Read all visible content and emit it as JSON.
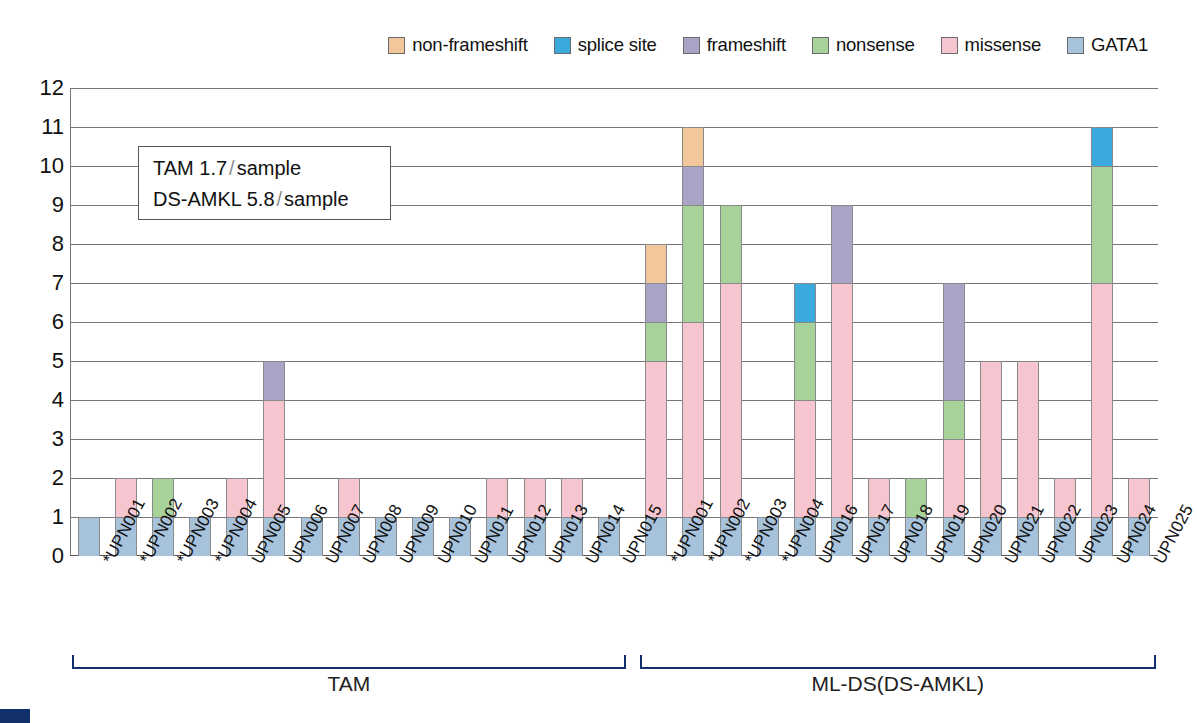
{
  "chart_data": {
    "type": "bar",
    "subtype": "stacked-bar",
    "title": "",
    "xlabel": "",
    "ylabel": "",
    "ylim": [
      0,
      12
    ],
    "ytick_labels": [
      "0",
      "1",
      "2",
      "3",
      "4",
      "5",
      "6",
      "7",
      "8",
      "9",
      "10",
      "11",
      "12"
    ],
    "grid": true,
    "legend_position": "top-right",
    "series": [
      {
        "name": "non-frameshift",
        "color": "#f3c79c"
      },
      {
        "name": "splice site",
        "color": "#3aa9dd"
      },
      {
        "name": "frameshift",
        "color": "#a9a4c6"
      },
      {
        "name": "nonsense",
        "color": "#a7d39b"
      },
      {
        "name": "missense",
        "color": "#f7c5cf"
      },
      {
        "name": "GATA1",
        "color": "#a7c3dc"
      }
    ],
    "stack_order_bottom_to_top": [
      "GATA1",
      "missense",
      "nonsense",
      "frameshift",
      "splice site",
      "non-frameshift"
    ],
    "groups": [
      {
        "label": "TAM",
        "categories": [
          "*UPN001",
          "*UPN002",
          "*UPN003",
          "*UPN004",
          "UPN005",
          "UPN006",
          "UPN007",
          "UPN008",
          "UPN009",
          "UPN010",
          "UPN011",
          "UPN012",
          "UPN013",
          "UPN014",
          "UPN015"
        ],
        "values": {
          "GATA1": [
            1,
            1,
            1,
            1,
            1,
            1,
            1,
            1,
            1,
            1,
            1,
            1,
            1,
            1,
            1
          ],
          "missense": [
            0,
            1,
            0,
            0,
            1,
            3,
            0,
            1,
            0,
            0,
            0,
            1,
            1,
            1,
            0
          ],
          "nonsense": [
            0,
            0,
            1,
            0,
            0,
            0,
            0,
            0,
            0,
            0,
            0,
            0,
            0,
            0,
            0
          ],
          "frameshift": [
            0,
            0,
            0,
            0,
            0,
            1,
            0,
            0,
            0,
            0,
            0,
            0,
            0,
            0,
            0
          ],
          "splice site": [
            0,
            0,
            0,
            0,
            0,
            0,
            0,
            0,
            0,
            0,
            0,
            0,
            0,
            0,
            0
          ],
          "non-frameshift": [
            0,
            0,
            0,
            0,
            0,
            0,
            0,
            0,
            0,
            0,
            0,
            0,
            0,
            0,
            0
          ]
        },
        "totals": [
          1,
          2,
          2,
          1,
          2,
          5,
          1,
          2,
          1,
          1,
          1,
          2,
          2,
          2,
          1
        ]
      },
      {
        "label": "ML-DS(DS-AMKL)",
        "categories": [
          "*UPN001",
          "*UPN002",
          "*UPN003",
          "*UPN004",
          "UPN016",
          "UPN017",
          "UPN018",
          "UPN019",
          "UPN020",
          "UPN021",
          "UPN022",
          "UPN023",
          "UPN024",
          "UPN025"
        ],
        "values": {
          "GATA1": [
            1,
            1,
            1,
            1,
            1,
            1,
            1,
            1,
            1,
            1,
            1,
            1,
            1,
            1
          ],
          "missense": [
            4,
            5,
            6,
            0,
            3,
            6,
            1,
            0,
            2,
            4,
            4,
            1,
            6,
            1
          ],
          "nonsense": [
            1,
            3,
            2,
            0,
            2,
            0,
            0,
            1,
            1,
            0,
            0,
            0,
            3,
            0
          ],
          "frameshift": [
            1,
            1,
            0,
            0,
            0,
            2,
            0,
            0,
            3,
            0,
            0,
            0,
            0,
            0
          ],
          "splice site": [
            0,
            0,
            0,
            0,
            1,
            0,
            0,
            0,
            0,
            0,
            0,
            0,
            1,
            0
          ],
          "non-frameshift": [
            1,
            1,
            0,
            0,
            0,
            0,
            0,
            0,
            0,
            0,
            0,
            0,
            0,
            0
          ]
        },
        "totals": [
          8,
          11,
          9,
          1,
          7,
          9,
          2,
          2,
          7,
          5,
          5,
          2,
          11,
          2
        ]
      }
    ],
    "annotations": [
      {
        "text_parts": [
          "TAM 1.7",
          "/",
          "sample"
        ]
      },
      {
        "text_parts": [
          "DS-AMKL 5.8",
          "/",
          "sample"
        ]
      }
    ]
  },
  "legend": {
    "items": [
      {
        "label": "non-frameshift",
        "color": "#f3c79c"
      },
      {
        "label": "splice site",
        "color": "#3aa9dd"
      },
      {
        "label": "frameshift",
        "color": "#a9a4c6"
      },
      {
        "label": "nonsense",
        "color": "#a7d39b"
      },
      {
        "label": "missense",
        "color": "#f7c5cf"
      },
      {
        "label": "GATA1",
        "color": "#a7c3dc"
      }
    ]
  },
  "annotation_box": {
    "line1_main": "TAM 1.7",
    "line1_slash": "/",
    "line1_tail": "sample",
    "line2_main": "DS-AMKL 5.8",
    "line2_slash": "/",
    "line2_tail": "sample"
  },
  "group_labels": {
    "tam": "TAM",
    "mlds": "ML-DS(DS-AMKL)"
  },
  "colors": {
    "non_frameshift": "#f3c79c",
    "splice_site": "#3aa9dd",
    "frameshift": "#a9a4c6",
    "nonsense": "#a7d39b",
    "missense": "#f7c5cf",
    "gata1": "#a7c3dc",
    "bracket": "#12306b",
    "grid": "#777777"
  }
}
